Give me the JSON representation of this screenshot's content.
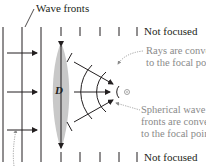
{
  "labels": {
    "wave_fronts": "Wave fronts",
    "not_focused_top": "Not focused",
    "not_focused_bottom": "Not focused",
    "rays_line1": "Rays are converging",
    "rays_line2": "to the focal point.",
    "spherical_line1": "Spherical wave",
    "spherical_line2": "fronts are converging",
    "spherical_line3": "to the focal point.",
    "aperture": "D"
  },
  "colors": {
    "line": "#231f20",
    "lens_fill": "#c8c8c8",
    "annotation_gray": "#8a8a8a"
  }
}
